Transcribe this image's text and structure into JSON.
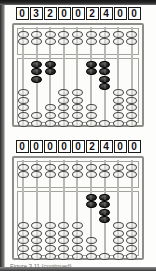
{
  "document": {
    "caption": "Figure 3.11 (continued)"
  },
  "figures": [
    {
      "name": "abacus-top",
      "digits": [
        "0",
        "3",
        "2",
        "0",
        "0",
        "2",
        "4",
        "0",
        "0"
      ],
      "rod_count": 9,
      "upper_deck": {
        "beads_per_rod": 2,
        "activated_per_rod": [
          0,
          0,
          0,
          0,
          0,
          0,
          0,
          0,
          0
        ]
      },
      "lower_deck": {
        "beads_per_rod": 5,
        "activated_per_rod": [
          0,
          3,
          2,
          0,
          0,
          2,
          4,
          0,
          0
        ]
      }
    },
    {
      "name": "abacus-bottom",
      "digits": [
        "0",
        "0",
        "0",
        "0",
        "0",
        "2",
        "4",
        "0",
        "0"
      ],
      "rod_count": 9,
      "upper_deck": {
        "beads_per_rod": 2,
        "activated_per_rod": [
          0,
          0,
          0,
          0,
          0,
          0,
          0,
          0,
          0
        ]
      },
      "lower_deck": {
        "beads_per_rod": 5,
        "activated_per_rod": [
          0,
          0,
          0,
          0,
          0,
          2,
          4,
          0,
          0
        ]
      }
    }
  ],
  "colors": {
    "bead_inactive": "#eeeeea",
    "bead_active": "#1a1a1a",
    "frame": "#8d8d8a",
    "digit_border": "#191919"
  }
}
